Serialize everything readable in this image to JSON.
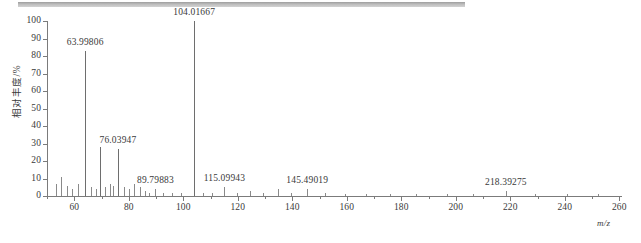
{
  "figure": {
    "kind": "mass-spectrum",
    "top_rule_color": "#b5b5b5",
    "axis_color": "#7b7b7b",
    "peak_color": "#8a8a8a"
  },
  "chart_data": {
    "type": "bar",
    "title": "",
    "subtitle": "",
    "xlabel": "m/z",
    "ylabel": "相对丰度/%",
    "xlim": [
      50,
      261
    ],
    "ylim": [
      0,
      100
    ],
    "grid": false,
    "legend": "none",
    "xticks": [
      60,
      80,
      100,
      120,
      140,
      160,
      180,
      200,
      220,
      240,
      260
    ],
    "xticklabels": [
      "60",
      "80",
      "100",
      "120",
      "140",
      "160",
      "180",
      "200",
      "220",
      "240",
      "260"
    ],
    "xminorticks": [
      50,
      70,
      90,
      110,
      130,
      150,
      170,
      190,
      210,
      230,
      250
    ],
    "yticks": [
      0,
      10,
      20,
      30,
      40,
      50,
      60,
      70,
      80,
      90,
      100
    ],
    "yticklabels": [
      "0",
      "10",
      "20",
      "30",
      "40",
      "50",
      "60",
      "70",
      "80",
      "90",
      "100"
    ],
    "x": [
      53.2,
      55.1,
      57.3,
      59.0,
      61.4,
      63.99806,
      66.2,
      68.1,
      69.6,
      71.3,
      73.0,
      74.4,
      76.03947,
      78.2,
      80.1,
      82.0,
      84.3,
      86.1,
      87.4,
      89.79883,
      92.5,
      95.8,
      99.2,
      104.01667,
      107.4,
      110.6,
      115.09943,
      119.8,
      124.6,
      129.3,
      134.7,
      139.5,
      145.49019,
      152.1,
      159.4,
      167.2,
      176.0,
      185.3,
      196.7,
      206.4,
      218.39275,
      229.1,
      240.8,
      252.3
    ],
    "values": [
      7,
      11,
      6,
      4,
      7,
      83,
      5,
      4,
      28,
      5,
      7,
      6,
      27,
      5,
      4,
      7,
      5,
      3,
      2,
      4,
      2,
      2,
      2,
      100,
      2,
      2,
      5,
      2,
      3,
      2,
      4,
      2,
      4,
      2,
      1,
      1,
      1,
      1,
      1,
      1,
      3,
      1,
      1,
      1
    ],
    "annotations": [
      {
        "label": "63.99806",
        "x": 63.99806,
        "y": 83
      },
      {
        "label": "76.03947",
        "x": 76.03947,
        "y": 27
      },
      {
        "label": "104.01667",
        "x": 104.01667,
        "y": 100
      },
      {
        "label": "89.79883",
        "x": 89.79883,
        "y": 4
      },
      {
        "label": "115.09943",
        "x": 115.09943,
        "y": 5
      },
      {
        "label": "145.49019",
        "x": 145.49019,
        "y": 4
      },
      {
        "label": "218.39275",
        "x": 218.39275,
        "y": 3
      }
    ]
  }
}
